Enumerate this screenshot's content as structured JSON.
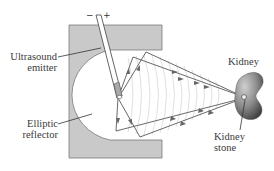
{
  "diagram": {
    "labels": {
      "ultrasound_emitter": [
        "Ultrasound",
        "emitter"
      ],
      "elliptic_reflector": [
        "Elliptic",
        "reflector"
      ],
      "kidney": "Kidney",
      "kidney_stone": [
        "Kidney",
        "stone"
      ]
    },
    "polarity": {
      "minus": "−",
      "plus": "+"
    },
    "colors": {
      "reflector_fill": "#c9c9c9",
      "reflector_edge": "#7a7a7a",
      "ray": "#6a6a6a",
      "wavefront": "#d4d4d4",
      "kidney_light": "#b8b8b8",
      "kidney_dark": "#3c3c3c",
      "text": "#3a3a3a"
    }
  }
}
